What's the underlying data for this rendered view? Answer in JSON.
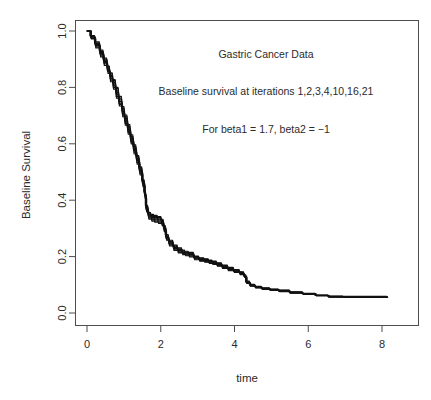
{
  "figure": {
    "background": "#ffffff",
    "width": 431,
    "height": 400
  },
  "annotations": {
    "title_text": "Gastric Cancer Data",
    "subtitle_text": "Baseline survival at iterations 1,2,3,4,10,16,21",
    "param_text": "For beta1 = 1.7, beta2 = −1"
  },
  "axes": {
    "x_title": "time",
    "y_title": "Baseline Survival",
    "x_ticks": [
      "0",
      "2",
      "4",
      "6",
      "8"
    ],
    "y_ticks": [
      "0.0",
      "0.2",
      "0.4",
      "0.6",
      "0.8",
      "1.0"
    ]
  },
  "chart_data": {
    "type": "line",
    "title": "Gastric Cancer Data",
    "subtitle": "Baseline survival at iterations 1,2,3,4,10,16,21",
    "annotation": "For beta1 = 1.7, beta2 = −1",
    "xlabel": "time",
    "ylabel": "Baseline Survival",
    "xlim": [
      -0.33,
      8.65
    ],
    "ylim": [
      -0.035,
      1.035
    ],
    "xticks": [
      0,
      2,
      4,
      6,
      8
    ],
    "yticks": [
      0.0,
      0.2,
      0.4,
      0.6,
      0.8,
      1.0
    ],
    "grid": false,
    "legend": "none",
    "legend_position": "none",
    "line_color": "#111111",
    "series": [
      {
        "name": "iteration 1",
        "offset": 0.0,
        "x": [
          0.0,
          0.1,
          0.22,
          0.35,
          0.45,
          0.55,
          0.62,
          0.7,
          0.78,
          0.86,
          0.95,
          1.02,
          1.1,
          1.18,
          1.26,
          1.34,
          1.42,
          1.5,
          1.56,
          1.6,
          1.66,
          1.74,
          1.82,
          1.92,
          2.02,
          2.08,
          2.14,
          2.22,
          2.34,
          2.46,
          2.58,
          2.66,
          2.76,
          2.9,
          3.04,
          3.18,
          3.3,
          3.4,
          3.52,
          3.66,
          3.82,
          3.98,
          4.14,
          4.26,
          4.32,
          4.42,
          4.56,
          4.74,
          4.96,
          5.2,
          5.5,
          5.85,
          6.2,
          6.55,
          6.95,
          7.4,
          7.8,
          8.15
        ],
        "y": [
          1.0,
          0.978,
          0.952,
          0.92,
          0.892,
          0.862,
          0.838,
          0.812,
          0.782,
          0.75,
          0.714,
          0.684,
          0.65,
          0.616,
          0.58,
          0.544,
          0.504,
          0.462,
          0.42,
          0.37,
          0.345,
          0.338,
          0.334,
          0.33,
          0.322,
          0.3,
          0.268,
          0.248,
          0.232,
          0.222,
          0.214,
          0.212,
          0.208,
          0.196,
          0.19,
          0.186,
          0.182,
          0.178,
          0.172,
          0.164,
          0.156,
          0.148,
          0.14,
          0.13,
          0.108,
          0.098,
          0.092,
          0.086,
          0.082,
          0.078,
          0.072,
          0.068,
          0.062,
          0.058,
          0.057,
          0.057,
          0.057,
          0.057
        ]
      },
      {
        "name": "iteration 2",
        "offset": 0.012,
        "x": [
          0.0,
          0.1,
          0.22,
          0.35,
          0.45,
          0.55,
          0.62,
          0.7,
          0.78,
          0.86,
          0.95,
          1.02,
          1.1,
          1.18,
          1.26,
          1.34,
          1.42,
          1.5,
          1.56,
          1.6,
          1.66,
          1.74,
          1.82,
          1.92,
          2.02,
          2.08,
          2.14,
          2.22,
          2.34,
          2.46,
          2.58,
          2.66,
          2.76,
          2.9,
          3.04,
          3.18,
          3.3,
          3.4,
          3.52,
          3.66,
          3.82,
          3.98,
          4.14,
          4.26,
          4.32,
          4.42,
          4.56,
          4.74,
          4.96,
          5.2,
          5.5,
          5.85,
          6.2,
          6.55,
          6.95,
          7.4,
          7.8,
          8.15
        ],
        "y": [
          1.0,
          0.974,
          0.944,
          0.914,
          0.884,
          0.856,
          0.826,
          0.8,
          0.768,
          0.74,
          0.702,
          0.672,
          0.64,
          0.606,
          0.57,
          0.534,
          0.496,
          0.454,
          0.412,
          0.362,
          0.337,
          0.33,
          0.326,
          0.322,
          0.314,
          0.292,
          0.262,
          0.242,
          0.226,
          0.216,
          0.21,
          0.206,
          0.202,
          0.192,
          0.186,
          0.182,
          0.178,
          0.174,
          0.168,
          0.16,
          0.152,
          0.146,
          0.138,
          0.128,
          0.106,
          0.096,
          0.09,
          0.085,
          0.081,
          0.077,
          0.071,
          0.067,
          0.062,
          0.057,
          0.056,
          0.056,
          0.056,
          0.056
        ]
      },
      {
        "name": "iteration 3",
        "offset": -0.012,
        "x": [
          0.0,
          0.1,
          0.22,
          0.35,
          0.45,
          0.55,
          0.62,
          0.7,
          0.78,
          0.86,
          0.95,
          1.02,
          1.1,
          1.18,
          1.26,
          1.34,
          1.42,
          1.5,
          1.56,
          1.6,
          1.66,
          1.74,
          1.82,
          1.92,
          2.02,
          2.08,
          2.14,
          2.22,
          2.34,
          2.46,
          2.58,
          2.66,
          2.76,
          2.9,
          3.04,
          3.18,
          3.3,
          3.4,
          3.52,
          3.66,
          3.82,
          3.98,
          4.14,
          4.26,
          4.32,
          4.42,
          4.56,
          4.74,
          4.96,
          5.2,
          5.5,
          5.85,
          6.2,
          6.55,
          6.95,
          7.4,
          7.8,
          8.15
        ],
        "y": [
          1.0,
          0.982,
          0.958,
          0.928,
          0.9,
          0.872,
          0.848,
          0.824,
          0.796,
          0.762,
          0.726,
          0.696,
          0.662,
          0.626,
          0.59,
          0.554,
          0.514,
          0.47,
          0.428,
          0.378,
          0.352,
          0.346,
          0.342,
          0.338,
          0.328,
          0.306,
          0.274,
          0.254,
          0.238,
          0.228,
          0.22,
          0.216,
          0.212,
          0.2,
          0.194,
          0.19,
          0.186,
          0.182,
          0.176,
          0.168,
          0.16,
          0.152,
          0.144,
          0.133,
          0.111,
          0.1,
          0.094,
          0.088,
          0.084,
          0.08,
          0.074,
          0.069,
          0.063,
          0.059,
          0.058,
          0.058,
          0.058,
          0.058
        ]
      },
      {
        "name": "iteration 4",
        "offset": 0.006,
        "x": [
          0.0,
          0.1,
          0.22,
          0.35,
          0.45,
          0.55,
          0.62,
          0.7,
          0.78,
          0.86,
          0.95,
          1.02,
          1.1,
          1.18,
          1.26,
          1.34,
          1.42,
          1.5,
          1.56,
          1.6,
          1.66,
          1.74,
          1.82,
          1.92,
          2.02,
          2.08,
          2.14,
          2.22,
          2.34,
          2.46,
          2.58,
          2.66,
          2.76,
          2.9,
          3.04,
          3.18,
          3.3,
          3.4,
          3.52,
          3.66,
          3.82,
          3.98,
          4.14,
          4.26,
          4.32,
          4.42,
          4.56,
          4.74,
          4.96,
          5.2,
          5.5,
          5.85,
          6.2,
          6.55,
          6.95,
          7.4,
          7.8,
          8.15
        ],
        "y": [
          1.0,
          0.976,
          0.948,
          0.918,
          0.888,
          0.858,
          0.832,
          0.806,
          0.776,
          0.744,
          0.708,
          0.678,
          0.646,
          0.61,
          0.576,
          0.54,
          0.5,
          0.458,
          0.416,
          0.366,
          0.341,
          0.334,
          0.33,
          0.326,
          0.318,
          0.296,
          0.265,
          0.245,
          0.229,
          0.219,
          0.212,
          0.209,
          0.205,
          0.194,
          0.188,
          0.184,
          0.18,
          0.176,
          0.17,
          0.162,
          0.154,
          0.147,
          0.139,
          0.129,
          0.107,
          0.097,
          0.091,
          0.086,
          0.082,
          0.078,
          0.072,
          0.068,
          0.062,
          0.058,
          0.057,
          0.057,
          0.057,
          0.057
        ]
      },
      {
        "name": "iteration 10",
        "offset": -0.006,
        "x": [
          0.0,
          0.1,
          0.22,
          0.35,
          0.45,
          0.55,
          0.62,
          0.7,
          0.78,
          0.86,
          0.95,
          1.02,
          1.1,
          1.18,
          1.26,
          1.34,
          1.42,
          1.5,
          1.56,
          1.6,
          1.66,
          1.74,
          1.82,
          1.92,
          2.02,
          2.08,
          2.14,
          2.22,
          2.34,
          2.46,
          2.58,
          2.66,
          2.76,
          2.9,
          3.04,
          3.18,
          3.3,
          3.4,
          3.52,
          3.66,
          3.82,
          3.98,
          4.14,
          4.26,
          4.32,
          4.42,
          4.56,
          4.74,
          4.96,
          5.2,
          5.5,
          5.85,
          6.2,
          6.55,
          6.95,
          7.4,
          7.8,
          8.15
        ],
        "y": [
          1.0,
          0.98,
          0.955,
          0.924,
          0.896,
          0.866,
          0.842,
          0.818,
          0.788,
          0.756,
          0.72,
          0.69,
          0.656,
          0.62,
          0.584,
          0.548,
          0.508,
          0.466,
          0.424,
          0.374,
          0.348,
          0.342,
          0.338,
          0.334,
          0.325,
          0.303,
          0.271,
          0.251,
          0.235,
          0.225,
          0.217,
          0.214,
          0.21,
          0.198,
          0.192,
          0.188,
          0.184,
          0.18,
          0.174,
          0.166,
          0.158,
          0.15,
          0.142,
          0.131,
          0.109,
          0.099,
          0.093,
          0.087,
          0.083,
          0.079,
          0.073,
          0.069,
          0.063,
          0.058,
          0.057,
          0.057,
          0.057,
          0.057
        ]
      },
      {
        "name": "iteration 16",
        "offset": 0.018,
        "x": [
          0.0,
          0.1,
          0.22,
          0.35,
          0.45,
          0.55,
          0.62,
          0.7,
          0.78,
          0.86,
          0.95,
          1.02,
          1.1,
          1.18,
          1.26,
          1.34,
          1.42,
          1.5,
          1.56,
          1.6,
          1.66,
          1.74,
          1.82,
          1.92,
          2.02,
          2.08,
          2.14,
          2.22,
          2.34,
          2.46,
          2.58,
          2.66,
          2.76,
          2.9,
          3.04,
          3.18,
          3.3,
          3.4,
          3.52,
          3.66,
          3.82,
          3.98,
          4.14,
          4.26,
          4.32,
          4.42,
          4.56,
          4.74,
          4.96,
          5.2,
          5.5,
          5.85,
          6.2,
          6.55,
          6.95,
          7.4,
          7.8,
          8.15
        ],
        "y": [
          1.0,
          0.972,
          0.94,
          0.908,
          0.878,
          0.85,
          0.82,
          0.794,
          0.762,
          0.734,
          0.696,
          0.666,
          0.634,
          0.6,
          0.564,
          0.528,
          0.49,
          0.448,
          0.406,
          0.358,
          0.333,
          0.326,
          0.322,
          0.318,
          0.31,
          0.288,
          0.258,
          0.238,
          0.222,
          0.213,
          0.207,
          0.203,
          0.199,
          0.189,
          0.184,
          0.18,
          0.176,
          0.172,
          0.166,
          0.158,
          0.15,
          0.144,
          0.136,
          0.126,
          0.105,
          0.095,
          0.089,
          0.084,
          0.08,
          0.076,
          0.07,
          0.066,
          0.061,
          0.056,
          0.055,
          0.055,
          0.055,
          0.055
        ]
      },
      {
        "name": "iteration 21",
        "offset": -0.018,
        "x": [
          0.0,
          0.1,
          0.22,
          0.35,
          0.45,
          0.55,
          0.62,
          0.7,
          0.78,
          0.86,
          0.95,
          1.02,
          1.1,
          1.18,
          1.26,
          1.34,
          1.42,
          1.5,
          1.56,
          1.6,
          1.66,
          1.74,
          1.82,
          1.92,
          2.02,
          2.08,
          2.14,
          2.22,
          2.34,
          2.46,
          2.58,
          2.66,
          2.76,
          2.9,
          3.04,
          3.18,
          3.3,
          3.4,
          3.52,
          3.66,
          3.82,
          3.98,
          4.14,
          4.26,
          4.32,
          4.42,
          4.56,
          4.74,
          4.96,
          5.2,
          5.5,
          5.85,
          6.2,
          6.55,
          6.95,
          7.4,
          7.8,
          8.15
        ],
        "y": [
          1.0,
          0.984,
          0.962,
          0.932,
          0.904,
          0.876,
          0.852,
          0.828,
          0.8,
          0.768,
          0.732,
          0.702,
          0.668,
          0.632,
          0.596,
          0.558,
          0.518,
          0.474,
          0.432,
          0.382,
          0.356,
          0.35,
          0.346,
          0.342,
          0.332,
          0.31,
          0.278,
          0.258,
          0.241,
          0.231,
          0.223,
          0.219,
          0.215,
          0.202,
          0.196,
          0.192,
          0.188,
          0.184,
          0.178,
          0.17,
          0.162,
          0.154,
          0.146,
          0.135,
          0.113,
          0.102,
          0.095,
          0.089,
          0.085,
          0.081,
          0.075,
          0.07,
          0.064,
          0.06,
          0.059,
          0.059,
          0.059,
          0.059
        ]
      }
    ]
  }
}
